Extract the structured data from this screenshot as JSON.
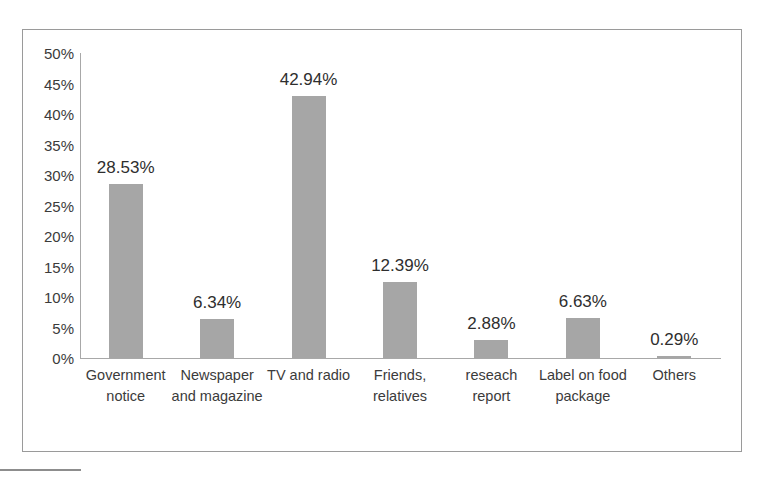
{
  "chart_data": {
    "type": "bar",
    "title": "",
    "xlabel": "",
    "ylabel": "",
    "ylim": [
      0,
      50
    ],
    "grid": false,
    "legend": null,
    "y_tick_labels": [
      "50%",
      "45%",
      "40%",
      "35%",
      "30%",
      "25%",
      "20%",
      "15%",
      "10%",
      "5%",
      "0%"
    ],
    "y_tick_values": [
      50,
      45,
      40,
      35,
      30,
      25,
      20,
      15,
      10,
      5,
      0
    ],
    "categories": [
      "Government notice",
      "Newspaper and magazine",
      "TV and radio",
      "Friends, relatives",
      "reseach report",
      "Label on food package",
      "Others"
    ],
    "values": [
      28.53,
      6.34,
      42.94,
      12.39,
      2.88,
      6.63,
      0.29
    ],
    "data_labels": [
      "28.53%",
      "6.34%",
      "42.94%",
      "12.39%",
      "2.88%",
      "6.63%",
      "0.29%"
    ],
    "bar_color": "#a6a6a6",
    "axis_color": "#a8a8a8",
    "text_color": "#3b3b3b"
  }
}
